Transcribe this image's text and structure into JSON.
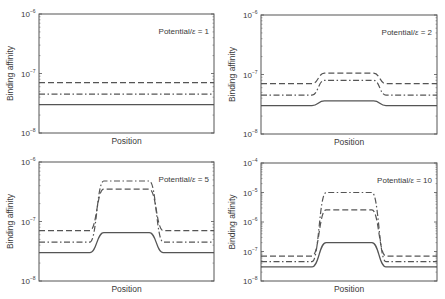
{
  "figure": {
    "xlabel": "Position",
    "ylabel": "Binding affinity",
    "annotation_prefix": "Potential/",
    "annotation_symbol": "ε",
    "colors": {
      "line": "#555555",
      "axis": "#555555",
      "text": "#3a3a3a",
      "background": "#ffffff"
    }
  },
  "chart_data": [
    {
      "type": "line",
      "title": "",
      "annotation": "Potential/ε = 1",
      "potential_ratio": 1,
      "xlabel": "Position",
      "ylabel": "Binding affinity",
      "yscale": "log",
      "ylim": [
        1e-08,
        1e-06
      ],
      "yticks": [
        "10^-8",
        "10^-7",
        "10^-6"
      ],
      "x": [
        0,
        0.29,
        0.34,
        0.66,
        0.71,
        1
      ],
      "series": [
        {
          "name": "dashed",
          "style": "dashed",
          "values": [
            7e-08,
            7e-08,
            7e-08,
            7e-08,
            7e-08,
            7e-08
          ]
        },
        {
          "name": "dash-dot",
          "style": "dashdot",
          "values": [
            4.5e-08,
            4.5e-08,
            4.5e-08,
            4.5e-08,
            4.5e-08,
            4.5e-08
          ]
        },
        {
          "name": "solid",
          "style": "solid",
          "values": [
            3e-08,
            3e-08,
            3e-08,
            3e-08,
            3e-08,
            3e-08
          ]
        }
      ],
      "box": {
        "x0": 39,
        "y0": 14,
        "x1": 214,
        "y1": 133
      }
    },
    {
      "type": "line",
      "title": "",
      "annotation": "Potential/ε = 2",
      "potential_ratio": 2,
      "xlabel": "Position",
      "ylabel": "Binding affinity",
      "yscale": "log",
      "ylim": [
        1e-08,
        1e-06
      ],
      "yticks": [
        "10^-8",
        "10^-7",
        "10^-6"
      ],
      "x": [
        0,
        0.29,
        0.36,
        0.64,
        0.71,
        1
      ],
      "series": [
        {
          "name": "dashed",
          "style": "dashed",
          "values": [
            7e-08,
            7e-08,
            1.05e-07,
            1.05e-07,
            7e-08,
            7e-08
          ]
        },
        {
          "name": "dash-dot",
          "style": "dashdot",
          "values": [
            4.5e-08,
            4.5e-08,
            8e-08,
            8e-08,
            4.5e-08,
            4.5e-08
          ]
        },
        {
          "name": "solid",
          "style": "solid",
          "values": [
            3e-08,
            3e-08,
            3.6e-08,
            3.6e-08,
            3e-08,
            3e-08
          ]
        }
      ],
      "box": {
        "x0": 261,
        "y0": 15,
        "x1": 437,
        "y1": 134
      }
    },
    {
      "type": "line",
      "title": "",
      "annotation": "Potential/ε = 5",
      "potential_ratio": 5,
      "xlabel": "Position",
      "ylabel": "Binding affinity",
      "yscale": "log",
      "ylim": [
        1e-08,
        1e-06
      ],
      "yticks": [
        "10^-8",
        "10^-7",
        "10^-6"
      ],
      "x": [
        0,
        0.29,
        0.37,
        0.63,
        0.71,
        1
      ],
      "series": [
        {
          "name": "dashed",
          "style": "dashed",
          "values": [
            7e-08,
            7e-08,
            3.5e-07,
            3.5e-07,
            7e-08,
            7e-08
          ]
        },
        {
          "name": "dash-dot",
          "style": "dashdot",
          "values": [
            4.5e-08,
            4.5e-08,
            4.8e-07,
            4.8e-07,
            4.5e-08,
            4.5e-08
          ]
        },
        {
          "name": "solid",
          "style": "solid",
          "values": [
            3e-08,
            3e-08,
            6.5e-08,
            6.5e-08,
            3e-08,
            3e-08
          ]
        }
      ],
      "box": {
        "x0": 39,
        "y0": 162,
        "x1": 214,
        "y1": 281
      }
    },
    {
      "type": "line",
      "title": "",
      "annotation": "Potential/ε = 10",
      "potential_ratio": 10,
      "xlabel": "Position",
      "ylabel": "Binding affinity",
      "yscale": "log",
      "ylim": [
        1e-08,
        0.0001
      ],
      "yticks": [
        "10^-8",
        "10^-7",
        "10^-6",
        "10^-5",
        "10^-4"
      ],
      "x": [
        0,
        0.29,
        0.37,
        0.63,
        0.71,
        1
      ],
      "series": [
        {
          "name": "dashed",
          "style": "dashed",
          "values": [
            7e-08,
            7e-08,
            2.6e-06,
            2.6e-06,
            7e-08,
            7e-08
          ]
        },
        {
          "name": "dash-dot",
          "style": "dashdot",
          "values": [
            4.5e-08,
            4.5e-08,
            1e-05,
            1e-05,
            4.5e-08,
            4.5e-08
          ]
        },
        {
          "name": "solid",
          "style": "solid",
          "values": [
            3e-08,
            3e-08,
            2e-07,
            2e-07,
            3e-08,
            3e-08
          ]
        }
      ],
      "box": {
        "x0": 261,
        "y0": 163,
        "x1": 437,
        "y1": 281
      }
    }
  ]
}
